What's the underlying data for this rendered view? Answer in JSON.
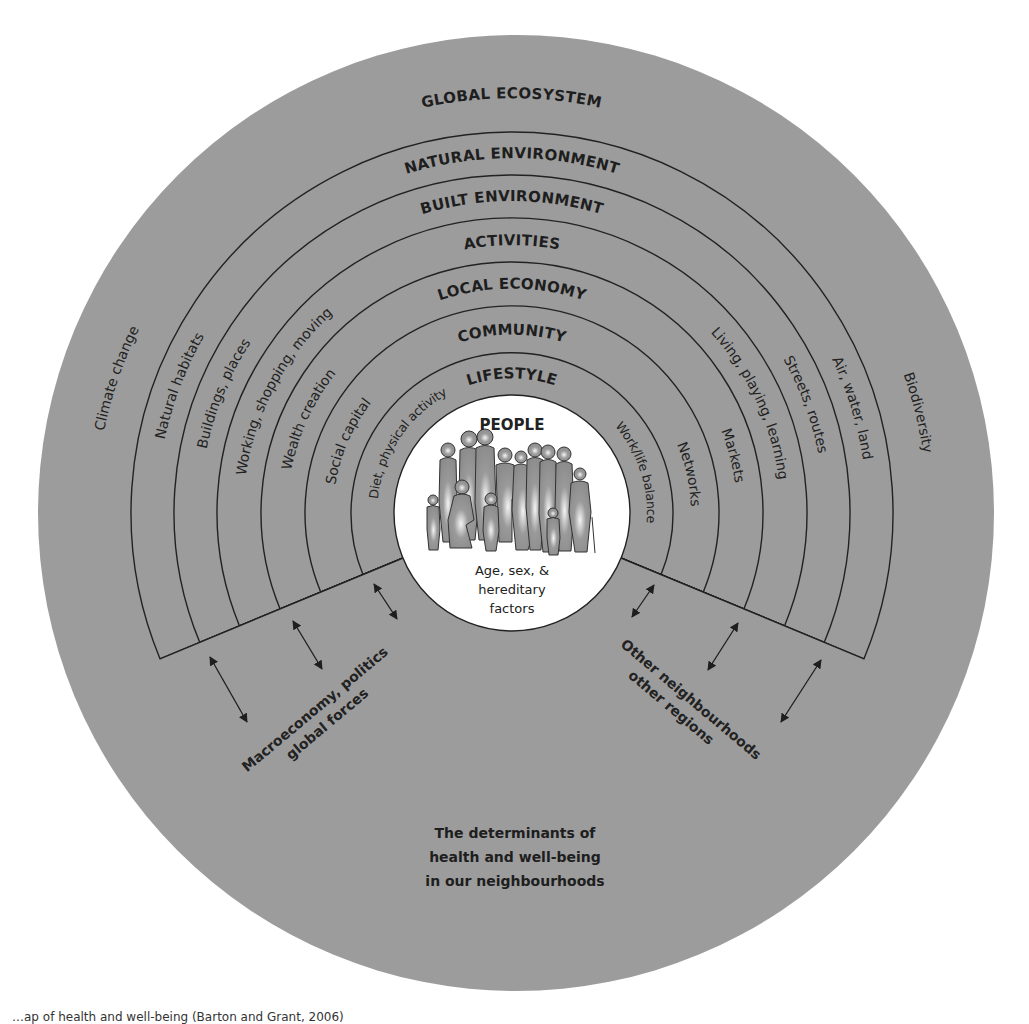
{
  "diagram": {
    "title_lines": [
      "The determinants of",
      "health and well-being",
      "in our neighbourhoods"
    ],
    "colors": {
      "outer_disc": "#9c9c9c",
      "natural_environment": "#bababa",
      "built_environment": "#b3b3b3",
      "activities": "#a9a9a9",
      "local_economy": "#cdcdcd",
      "community": "#d1d1d1",
      "lifestyle": "#d7d7d7",
      "people": "#ffffff",
      "lines": "#222222"
    },
    "outer": {
      "title": "GLOBAL ECOSYSTEM",
      "left_label": "Climate change",
      "right_label": "Biodiversity"
    },
    "rings": [
      {
        "title": "NATURAL ENVIRONMENT",
        "left_label": "Natural habitats",
        "right_label": "Air, water, land"
      },
      {
        "title": "BUILT ENVIRONMENT",
        "left_label": "Buildings, places",
        "right_label": "Streets, routes"
      },
      {
        "title": "ACTIVITIES",
        "left_label": "Working, shopping, moving",
        "right_label": "Living, playing, learning"
      },
      {
        "title": "LOCAL ECONOMY",
        "left_label": "Wealth creation",
        "right_label": "Markets"
      },
      {
        "title": "COMMUNITY",
        "left_label": "Social capital",
        "right_label": "Networks"
      },
      {
        "title": "LIFESTYLE",
        "left_label": "Diet, physical activity",
        "right_label": "Work/life balance"
      }
    ],
    "people": {
      "title": "PEOPLE",
      "sub_lines": [
        "Age, sex, &",
        "hereditary",
        "factors"
      ]
    },
    "external_forces": {
      "left_lines": [
        "Macroeconomy, politics",
        "global forces"
      ],
      "right_lines": [
        "Other neighbourhoods",
        "other regions"
      ]
    }
  },
  "caption": "…ap of health and well-being (Barton and Grant, 2006)"
}
